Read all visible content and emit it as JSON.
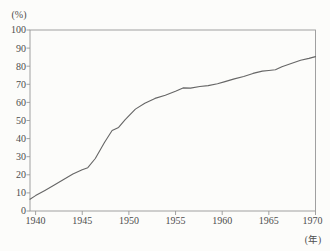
{
  "chart_data": {
    "type": "line",
    "title": "",
    "y_axis": {
      "unit_label": "(%)",
      "min": 0,
      "max": 100,
      "ticks": [
        0,
        10,
        20,
        30,
        40,
        50,
        60,
        70,
        80,
        90,
        100
      ]
    },
    "x_axis": {
      "unit_label": "(年)",
      "min": 1939.4,
      "max": 1970,
      "ticks": [
        1940,
        1945,
        1950,
        1955,
        1960,
        1965,
        1970
      ]
    },
    "grid": "off",
    "legend": "none",
    "series": [
      {
        "x": [
          1939.4,
          1940,
          1941,
          1942,
          1943,
          1944,
          1945,
          1945.6,
          1946.4,
          1947.4,
          1948.2,
          1948.9,
          1949.6,
          1950.7,
          1951.7,
          1952.8,
          1953.9,
          1955,
          1955.8,
          1956.6,
          1957.6,
          1958.5,
          1959.5,
          1960.3,
          1961.3,
          1962.3,
          1963.3,
          1964.3,
          1965,
          1965.7,
          1966.4,
          1967.4,
          1968.4,
          1969.3,
          1970
        ],
        "y": [
          6.5,
          8.5,
          11.3,
          14.3,
          17.4,
          20.4,
          22.8,
          23.9,
          29,
          38,
          44.5,
          46.2,
          50.5,
          56.3,
          59.5,
          62.2,
          64,
          66.2,
          68,
          67.9,
          68.8,
          69.3,
          70.3,
          71.5,
          73,
          74.3,
          76,
          77.3,
          77.6,
          78,
          79.7,
          81.5,
          83.3,
          84.3,
          85.3
        ]
      }
    ],
    "colors": {
      "line": "#666666",
      "axis": "#979797",
      "text": "#4d4d4d",
      "background": "#fcfcfa"
    }
  }
}
